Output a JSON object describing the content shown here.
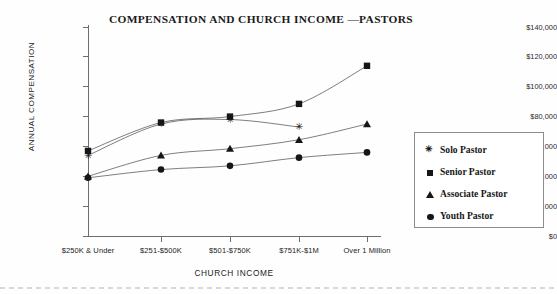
{
  "chart_data": {
    "type": "line",
    "title": "COMPENSATION AND CHURCH INCOME —PASTORS",
    "xlabel": "CHURCH INCOME",
    "ylabel": "ANNUAL COMPENSATION",
    "categories": [
      "$250K & Under",
      "$251-$500K",
      "$501-$750K",
      "$751K-$1M",
      "Over 1 Million"
    ],
    "ylim": [
      0,
      140000
    ],
    "yticks": [
      0,
      20000,
      40000,
      60000,
      80000,
      100000,
      120000,
      140000
    ],
    "ytick_labels": [
      "$0",
      "$20,000",
      "$40,000",
      "$60,000",
      "$80,000",
      "$100,000",
      "$120,000",
      "$140,000"
    ],
    "grid": false,
    "legend_position": "right",
    "series": [
      {
        "name": "Solo Pastor",
        "marker": "star",
        "color": "#161616",
        "values": [
          54000,
          75000,
          78000,
          73000,
          null
        ]
      },
      {
        "name": "Senior Pastor",
        "marker": "square",
        "color": "#161616",
        "values": [
          57000,
          76000,
          80000,
          88500,
          114000
        ]
      },
      {
        "name": "Associate Pastor",
        "marker": "triangle",
        "color": "#161616",
        "values": [
          40000,
          54000,
          58500,
          64500,
          75000
        ]
      },
      {
        "name": "Youth Pastor",
        "marker": "circle",
        "color": "#161616",
        "values": [
          39000,
          44500,
          47000,
          52500,
          56000
        ]
      }
    ]
  },
  "legend": {
    "items": [
      {
        "label": "Solo Pastor",
        "marker": "star"
      },
      {
        "label": "Senior Pastor",
        "marker": "square"
      },
      {
        "label": "Associate Pastor",
        "marker": "triangle"
      },
      {
        "label": "Youth Pastor",
        "marker": "circle"
      }
    ]
  },
  "yticks": {
    "t0": "$0",
    "t1": "$20,000",
    "t2": "$40,000",
    "t3": "$60,000",
    "t4": "$80,000",
    "t5": "$100,000",
    "t6": "$120,000",
    "t7": "$140,000"
  },
  "xticks": {
    "c0": "$250K & Under",
    "c1": "$251-$500K",
    "c2": "$501-$750K",
    "c3": "$751K-$1M",
    "c4": "Over 1 Million"
  }
}
